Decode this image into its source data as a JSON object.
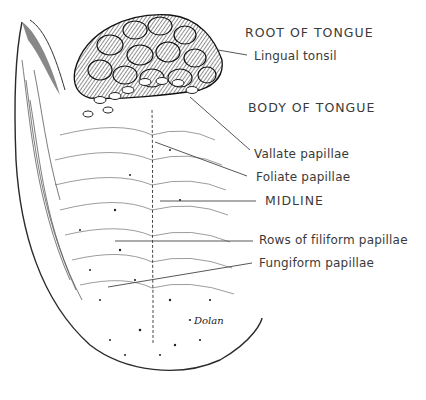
{
  "diagram": {
    "regions": [
      {
        "id": "root",
        "label": "ROOT OF TONGUE"
      },
      {
        "id": "body",
        "label": "BODY OF TONGUE"
      }
    ],
    "labels": [
      {
        "id": "lingual-tonsil",
        "text": "Lingual tonsil"
      },
      {
        "id": "vallate-papillae",
        "text": "Vallate papillae"
      },
      {
        "id": "foliate-papillae",
        "text": "Foliate papillae"
      },
      {
        "id": "midline",
        "text": "MIDLINE"
      },
      {
        "id": "filiform-rows",
        "text": "Rows of filiform papillae"
      },
      {
        "id": "fungiform-papillae",
        "text": "Fungiform papillae"
      }
    ],
    "signature": "Dolan",
    "colors": {
      "ink": "#2a2a2a",
      "text": "#3a3a3a",
      "background": "#ffffff"
    }
  }
}
